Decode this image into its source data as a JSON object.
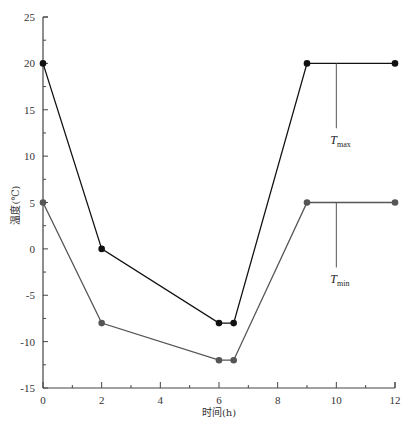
{
  "chart_data": {
    "type": "line",
    "title": "",
    "xlabel": "时间(h)",
    "ylabel": "温度(℃)",
    "xlim": [
      0,
      12
    ],
    "ylim": [
      -15,
      25
    ],
    "x_ticks": [
      0,
      2,
      4,
      6,
      8,
      10,
      12
    ],
    "y_ticks": [
      25,
      20,
      15,
      10,
      5,
      0,
      -5,
      -10,
      -15
    ],
    "grid": false,
    "legend": "none",
    "series": [
      {
        "name": "T_max",
        "label_main": "T",
        "label_sub": "max",
        "color": "#111111",
        "points": [
          [
            0,
            20
          ],
          [
            2,
            0
          ],
          [
            6,
            -8
          ],
          [
            6.5,
            -8
          ],
          [
            9,
            20
          ],
          [
            12,
            20
          ]
        ]
      },
      {
        "name": "T_min",
        "label_main": "T",
        "label_sub": "min",
        "color": "#555555",
        "points": [
          [
            0,
            5
          ],
          [
            2,
            -8
          ],
          [
            6,
            -12
          ],
          [
            6.5,
            -12
          ],
          [
            9,
            5
          ],
          [
            12,
            5
          ]
        ]
      }
    ],
    "annotations": [
      {
        "text": "T_max",
        "x": 10,
        "y_from": 20,
        "y_to": 13
      },
      {
        "text": "T_min",
        "x": 10,
        "y_from": 5,
        "y_to": -2
      }
    ]
  }
}
